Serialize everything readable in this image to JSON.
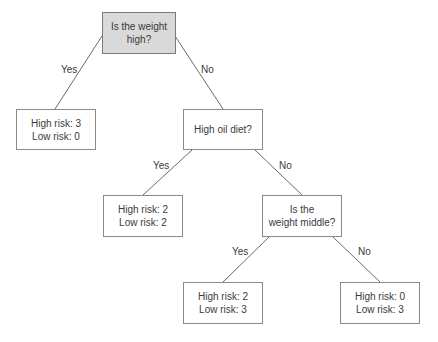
{
  "diagram": {
    "type": "decision-tree",
    "nodes": {
      "root": {
        "line1": "Is the weight",
        "line2": "high?"
      },
      "leaf_yes_1": {
        "line1": "High risk: 3",
        "line2": "Low risk: 0"
      },
      "oil": {
        "line1": "High oil diet?",
        "line2": ""
      },
      "leaf_yes_2": {
        "line1": "High risk: 2",
        "line2": "Low risk: 2"
      },
      "middle": {
        "line1": "Is the",
        "line2": "weight middle?"
      },
      "leaf_yes_3": {
        "line1": "High risk: 2",
        "line2": "Low risk: 3"
      },
      "leaf_no_3": {
        "line1": "High risk: 0",
        "line2": "Low risk: 3"
      }
    },
    "edges": {
      "root_yes": "Yes",
      "root_no": "No",
      "oil_yes": "Yes",
      "oil_no": "No",
      "middle_yes": "Yes",
      "middle_no": "No"
    },
    "colors": {
      "root_fill": "#d9d9d9",
      "node_fill": "#ffffff",
      "border": "#8a8a8a",
      "line": "#6a6a6a",
      "text": "#3a3a3a"
    }
  }
}
